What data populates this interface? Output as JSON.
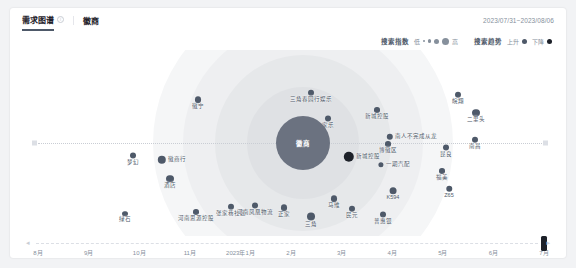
{
  "header": {
    "tabs": [
      {
        "label": "需求图谱",
        "icon": "info-icon",
        "active": true
      }
    ],
    "breadcrumb": "徽商",
    "date_range": "2023/07/31~2023/08/06"
  },
  "legend": {
    "size": {
      "title": "搜索指数",
      "min_label": "低",
      "max_label": "高",
      "sizes": [
        2,
        3.5,
        5,
        7
      ]
    },
    "trend": {
      "title": "搜索趋势",
      "items": [
        {
          "label": "上升",
          "color": "#4e5969"
        },
        {
          "label": "下降",
          "color": "#1d2129"
        }
      ]
    }
  },
  "chart_data": {
    "type": "scatter",
    "title": "需求图谱",
    "center": {
      "label": "徽商",
      "radius": 27,
      "color": "#6b7280"
    },
    "rings": [
      {
        "radius": 150,
        "color": "#f5f6f7"
      },
      {
        "radius": 120,
        "color": "#eeeff1"
      },
      {
        "radius": 88,
        "color": "#e6e8ea"
      },
      {
        "radius": 56,
        "color": "#dfe1e4"
      }
    ],
    "axis": {
      "type": "dotted-horizontal",
      "caps": true
    },
    "nodes": [
      {
        "label": "梦幻",
        "x": 121,
        "y": 147,
        "r": 3.2,
        "color": "#4e5969",
        "side": false
      },
      {
        "label": "徽商行",
        "x": 160,
        "y": 148,
        "r": 4.2,
        "color": "#4e5969",
        "side": true
      },
      {
        "label": "酒店",
        "x": 158,
        "y": 170,
        "r": 3.6,
        "color": "#4e5969",
        "side": false
      },
      {
        "label": "徽宁",
        "x": 186,
        "y": 91,
        "r": 3.4,
        "color": "#4e5969",
        "side": false
      },
      {
        "label": "绿石",
        "x": 113,
        "y": 205,
        "r": 2.6,
        "color": "#4e5969",
        "side": false
      },
      {
        "label": "河南思源控股",
        "x": 184,
        "y": 203,
        "r": 2.8,
        "color": "#4e5969",
        "side": false
      },
      {
        "label": "张家巷社区",
        "x": 219,
        "y": 198,
        "r": 3.0,
        "color": "#4e5969",
        "side": false
      },
      {
        "label": "河南凤凰物流",
        "x": 243,
        "y": 197,
        "r": 3.2,
        "color": "#4e5969",
        "side": false
      },
      {
        "label": "正家",
        "x": 272,
        "y": 199,
        "r": 3.4,
        "color": "#4e5969",
        "side": false
      },
      {
        "label": "三角",
        "x": 299,
        "y": 208,
        "r": 4.2,
        "color": "#4e5969",
        "side": false
      },
      {
        "label": "三角春园行娱乐",
        "x": 299,
        "y": 84,
        "r": 3.0,
        "color": "#4e5969",
        "side": false
      },
      {
        "label": "家乐",
        "x": 316,
        "y": 110,
        "r": 3.2,
        "color": "#4e5969",
        "side": false
      },
      {
        "label": "马维",
        "x": 322,
        "y": 190,
        "r": 3.4,
        "color": "#4e5969",
        "side": false
      },
      {
        "label": "民元",
        "x": 340,
        "y": 200,
        "r": 3.0,
        "color": "#4e5969",
        "side": false
      },
      {
        "label": "普惠银",
        "x": 371,
        "y": 206,
        "r": 3.2,
        "color": "#4e5969",
        "side": false
      },
      {
        "label": "新城控股",
        "x": 350,
        "y": 145,
        "r": 5.2,
        "color": "#1d2129",
        "side": true
      },
      {
        "label": "一期汽配",
        "x": 382,
        "y": 153,
        "r": 2.6,
        "color": "#4e5969",
        "side": true
      },
      {
        "label": "博徽区",
        "x": 376,
        "y": 135,
        "r": 2.8,
        "color": "#4e5969",
        "side": false
      },
      {
        "label": "K594",
        "x": 381,
        "y": 182,
        "r": 3.6,
        "color": "#4e5969",
        "side": false
      },
      {
        "label": "南人不完成从龙",
        "x": 400,
        "y": 125,
        "r": 3.2,
        "color": "#4e5969",
        "side": true
      },
      {
        "label": "新城控股",
        "x": 365,
        "y": 101,
        "r": 2.8,
        "color": "#4e5969",
        "side": false
      },
      {
        "label": "Z65",
        "x": 437,
        "y": 180,
        "r": 3.0,
        "color": "#4e5969",
        "side": false
      },
      {
        "label": "福美",
        "x": 430,
        "y": 162,
        "r": 2.8,
        "color": "#4e5969",
        "side": false
      },
      {
        "label": "昆良",
        "x": 434,
        "y": 139,
        "r": 3.2,
        "color": "#4e5969",
        "side": false
      },
      {
        "label": "南昌",
        "x": 463,
        "y": 131,
        "r": 3.0,
        "color": "#4e5969",
        "side": false
      },
      {
        "label": "二里头",
        "x": 464,
        "y": 104,
        "r": 3.6,
        "color": "#4e5969",
        "side": false
      },
      {
        "label": "皖翔",
        "x": 446,
        "y": 86,
        "r": 3.0,
        "color": "#4e5969",
        "side": false
      }
    ],
    "timeline": {
      "ticks": [
        "8月",
        "9月",
        "10月",
        "11月",
        "2023年1月",
        "2月",
        "3月",
        "4月",
        "5月",
        "6月",
        "7月"
      ],
      "handle_index": 10
    }
  }
}
